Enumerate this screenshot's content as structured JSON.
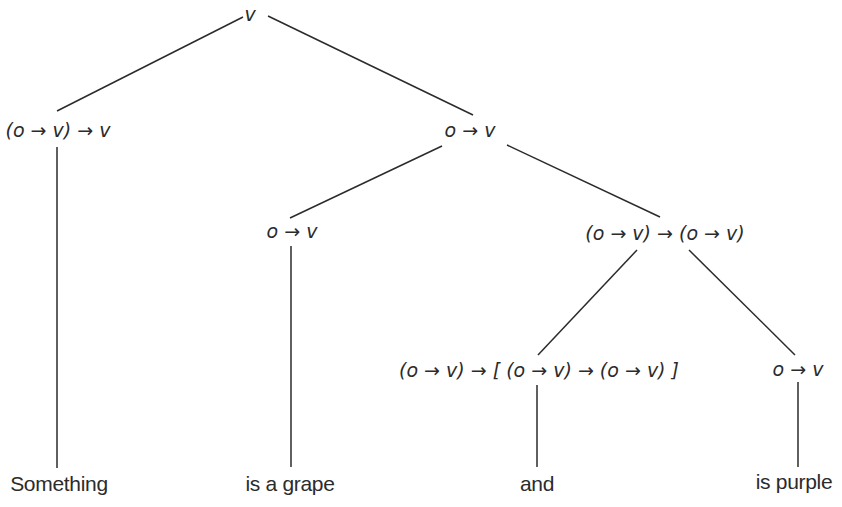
{
  "diagram": {
    "type": "type-derivation-tree",
    "nodes": {
      "root": {
        "label": "v"
      },
      "quantifier": {
        "label": "(o → v) → v"
      },
      "predicate_conj": {
        "label": "o → v"
      },
      "pred_grape": {
        "label": "o → v"
      },
      "conj_applied": {
        "label": "(o → v) → (o → v)"
      },
      "conj": {
        "label": "(o → v) → [ (o → v) → (o → v) ]"
      },
      "pred_purple": {
        "label": "o → v"
      }
    },
    "leaves": {
      "something": {
        "label": "Something"
      },
      "grape": {
        "label": "is a grape"
      },
      "and": {
        "label": "and"
      },
      "purple": {
        "label": "is purple"
      }
    },
    "edges": [
      {
        "from": "root",
        "to": "quantifier"
      },
      {
        "from": "root",
        "to": "predicate_conj"
      },
      {
        "from": "quantifier",
        "to": "something"
      },
      {
        "from": "predicate_conj",
        "to": "pred_grape"
      },
      {
        "from": "predicate_conj",
        "to": "conj_applied"
      },
      {
        "from": "pred_grape",
        "to": "grape"
      },
      {
        "from": "conj_applied",
        "to": "conj"
      },
      {
        "from": "conj_applied",
        "to": "pred_purple"
      },
      {
        "from": "conj",
        "to": "and"
      },
      {
        "from": "pred_purple",
        "to": "purple"
      }
    ],
    "colors": {
      "ink": "#2b2b2b",
      "background": "#ffffff"
    }
  }
}
